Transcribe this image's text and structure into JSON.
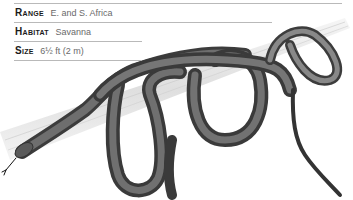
{
  "fact_panel": {
    "rows": [
      {
        "label": "Range",
        "value": "E. and S. Africa"
      },
      {
        "label": "Habitat",
        "value": "Savanna"
      },
      {
        "label": "Size",
        "value": "6½ ft (2 m)"
      }
    ]
  },
  "illustration": {
    "subject": "snake coiled on branch",
    "snake_color": "#555555",
    "branch_color": "#e2e2e2"
  }
}
